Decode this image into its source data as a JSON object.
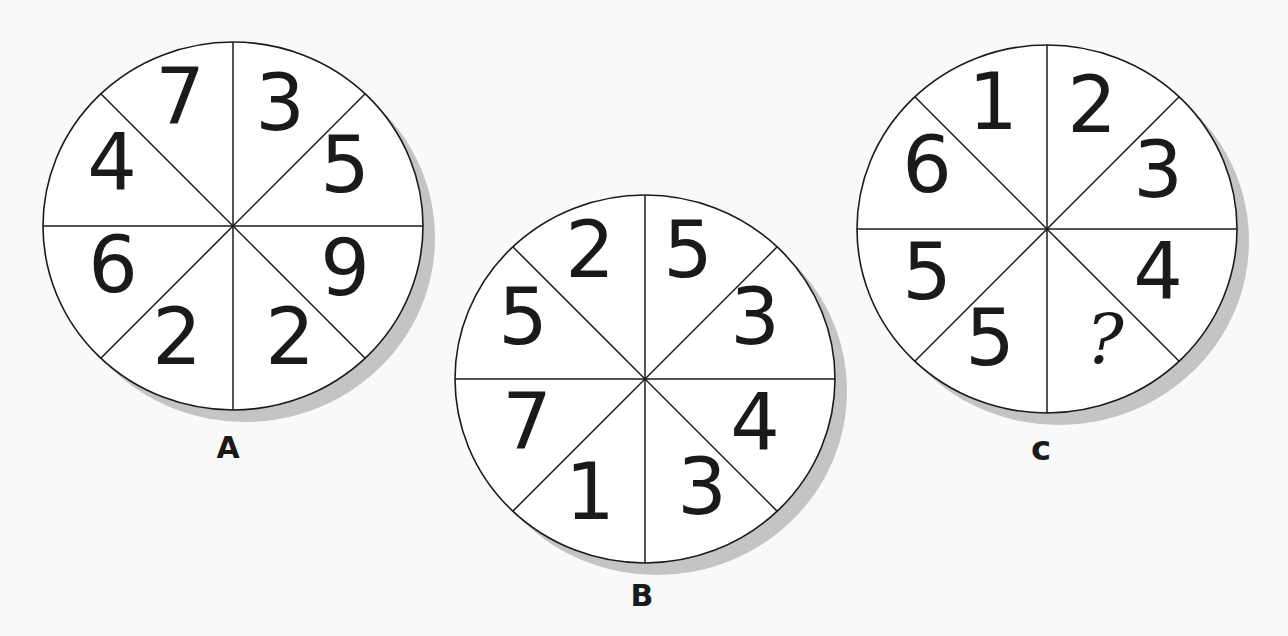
{
  "puzzle": {
    "circles": [
      {
        "label": "A",
        "center": [
          233,
          226
        ],
        "rx": 190,
        "ry": 184,
        "segments": [
          {
            "position": "top-left",
            "value": "7",
            "xy": [
              180,
              97
            ]
          },
          {
            "position": "top-right",
            "value": "3",
            "xy": [
              280,
              103
            ]
          },
          {
            "position": "right-top",
            "value": "5",
            "xy": [
              345,
              165
            ]
          },
          {
            "position": "right-bottom",
            "value": "9",
            "xy": [
              345,
              268
            ]
          },
          {
            "position": "bottom-right",
            "value": "2",
            "xy": [
              290,
              337
            ]
          },
          {
            "position": "bottom-left",
            "value": "2",
            "xy": [
              177,
              337
            ]
          },
          {
            "position": "left-bottom",
            "value": "6",
            "xy": [
              113,
              265
            ]
          },
          {
            "position": "left-top",
            "value": "4",
            "xy": [
              112,
              163
            ]
          }
        ],
        "label_xy": [
          228,
          458
        ]
      },
      {
        "label": "B",
        "center": [
          645,
          379
        ],
        "rx": 190,
        "ry": 184,
        "segments": [
          {
            "position": "top-left",
            "value": "2",
            "xy": [
              590,
              250
            ]
          },
          {
            "position": "top-right",
            "value": "5",
            "xy": [
              688,
              250
            ]
          },
          {
            "position": "right-top",
            "value": "3",
            "xy": [
              755,
              317
            ]
          },
          {
            "position": "right-bottom",
            "value": "4",
            "xy": [
              755,
              423
            ]
          },
          {
            "position": "bottom-right",
            "value": "3",
            "xy": [
              702,
              487
            ]
          },
          {
            "position": "bottom-left",
            "value": "1",
            "xy": [
              590,
              492
            ]
          },
          {
            "position": "left-bottom",
            "value": "7",
            "xy": [
              527,
              422
            ]
          },
          {
            "position": "left-top",
            "value": "5",
            "xy": [
              523,
              317
            ]
          }
        ],
        "label_xy": [
          642,
          606
        ]
      },
      {
        "label": "C",
        "center": [
          1047,
          229
        ],
        "rx": 190,
        "ry": 184,
        "segments": [
          {
            "position": "top-left",
            "value": "1",
            "xy": [
              993,
              102
            ]
          },
          {
            "position": "top-right",
            "value": "2",
            "xy": [
              1092,
              105
            ]
          },
          {
            "position": "right-top",
            "value": "3",
            "xy": [
              1158,
              170
            ]
          },
          {
            "position": "right-bottom",
            "value": "4",
            "xy": [
              1158,
              272
            ]
          },
          {
            "position": "bottom-right",
            "value": "?",
            "xy": [
              1105,
              340
            ]
          },
          {
            "position": "bottom-left",
            "value": "5",
            "xy": [
              990,
              338
            ]
          },
          {
            "position": "left-bottom",
            "value": "5",
            "xy": [
              927,
              272
            ]
          },
          {
            "position": "left-top",
            "value": "6",
            "xy": [
              927,
              165
            ]
          }
        ],
        "label_xy": [
          1041,
          460
        ]
      }
    ],
    "colors": {
      "background": "#f9f9f9",
      "circle_fill": "#ffffff",
      "ink": "#1a1a1a",
      "shadow": "#c4c4c4"
    },
    "shadow_offset": [
      12,
      12
    ]
  }
}
